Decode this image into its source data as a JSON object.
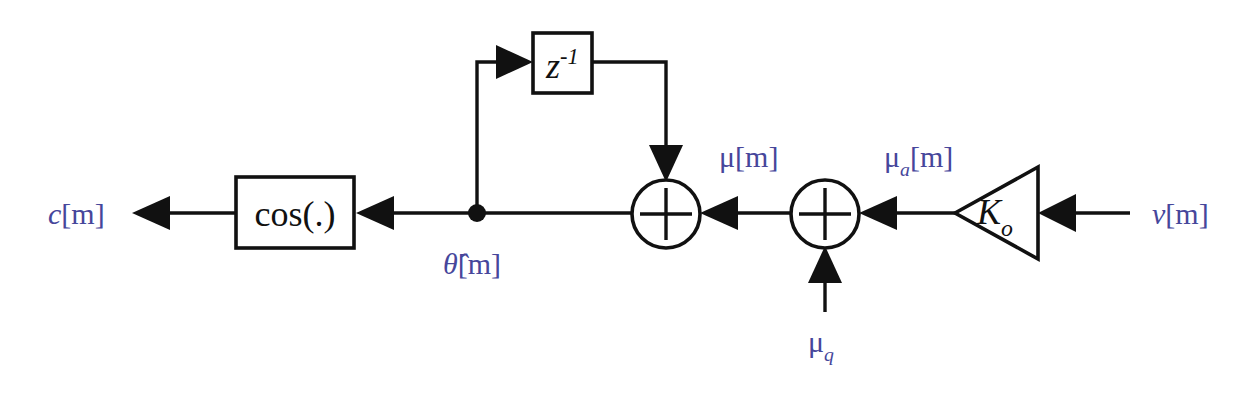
{
  "figure": {
    "kind": "signal-flow-block-diagram",
    "title": "",
    "background_color": "#ffffff",
    "line_color": "#111111",
    "signal_label_color": "#46469b",
    "block_label_color": "#111111"
  },
  "blocks": [
    {
      "id": "cosine-block",
      "shape": "rectangle",
      "label": "cos(.)",
      "label_style": "upright",
      "x": 236,
      "y": 177,
      "width": 118,
      "height": 71
    },
    {
      "id": "delay-block",
      "shape": "rectangle",
      "label_base": "z",
      "label_sup": "-1",
      "label_style": "italic",
      "x": 533,
      "y": 33,
      "width": 59,
      "height": 60
    },
    {
      "id": "gain-block",
      "shape": "triangle-pointing-left",
      "label_base": "K",
      "label_sub": "o",
      "label_style": "italic",
      "apex_x": 955,
      "apex_y": 213,
      "right_x": 1038,
      "top_y": 167,
      "bottom_y": 259
    },
    {
      "id": "adder-left",
      "shape": "circle-plus",
      "cx": 666,
      "cy": 214,
      "r": 34
    },
    {
      "id": "adder-right",
      "shape": "circle-plus",
      "cx": 825,
      "cy": 214,
      "r": 34
    }
  ],
  "nodes": [
    {
      "id": "theta-branch-node",
      "shape": "filled-dot",
      "cx": 477,
      "cy": 213,
      "r": 9
    }
  ],
  "signal_labels": [
    {
      "id": "output-c",
      "base": "c",
      "brackets": "[m]",
      "x": 48,
      "y": 224,
      "anchor": "start"
    },
    {
      "id": "theta-hat",
      "base": "θ̂",
      "brackets": "[m]",
      "x": 443,
      "y": 272,
      "anchor": "start",
      "has_hat": true
    },
    {
      "id": "mu",
      "base": "μ",
      "brackets": "[m]",
      "x": 719,
      "y": 167,
      "anchor": "start"
    },
    {
      "id": "mu-a",
      "base": "μ",
      "sub": "a",
      "brackets": "[m]",
      "x": 884,
      "y": 167,
      "anchor": "start"
    },
    {
      "id": "mu-q",
      "base": "μ",
      "sub": "q",
      "brackets": "",
      "x": 808,
      "y": 352,
      "anchor": "start"
    },
    {
      "id": "input-v",
      "base": "v",
      "brackets": "[m]",
      "x": 1152,
      "y": 224,
      "anchor": "start"
    }
  ],
  "connections": [
    {
      "id": "wire-cos-to-output",
      "from": "cosine-block",
      "to": "output-c",
      "direction": "left",
      "has_arrowhead": true
    },
    {
      "id": "wire-node-to-cos",
      "from": "theta-branch-node",
      "to": "cosine-block",
      "direction": "left",
      "has_arrowhead": true
    },
    {
      "id": "wire-adderleft-to-node",
      "from": "adder-left",
      "to": "theta-branch-node",
      "direction": "left",
      "has_arrowhead": false
    },
    {
      "id": "wire-node-up-to-delay",
      "from": "theta-branch-node",
      "to": "delay-block",
      "direction": "up-then-right",
      "has_arrowhead": true
    },
    {
      "id": "wire-delay-down-to-adderleft",
      "from": "delay-block",
      "to": "adder-left",
      "direction": "right-then-down",
      "has_arrowhead": true
    },
    {
      "id": "wire-adderright-to-adderleft",
      "from": "adder-right",
      "to": "adder-left",
      "direction": "left",
      "has_arrowhead": true
    },
    {
      "id": "wire-gain-to-adderright",
      "from": "gain-block",
      "to": "adder-right",
      "direction": "left",
      "has_arrowhead": true
    },
    {
      "id": "wire-muq-to-adderright",
      "from": "mu-q",
      "to": "adder-right",
      "direction": "up",
      "has_arrowhead": true
    },
    {
      "id": "wire-input-to-gain",
      "from": "input-v",
      "to": "gain-block",
      "direction": "left",
      "has_arrowhead": true
    }
  ]
}
